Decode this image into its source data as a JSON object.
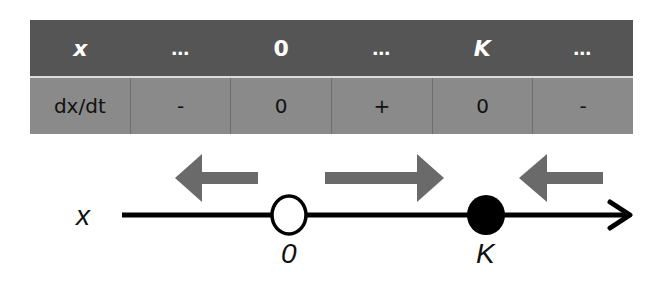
{
  "sign_table": {
    "header": [
      "x",
      "…",
      "0",
      "…",
      "K",
      "…"
    ],
    "row": [
      "dx/dt",
      "-",
      "0",
      "+",
      "0",
      "-"
    ]
  },
  "number_line": {
    "axis_label": "x",
    "points": [
      {
        "label": "0",
        "type": "open-circle",
        "meaning": "unstable equilibrium"
      },
      {
        "label": "K",
        "type": "filled-circle",
        "meaning": "stable equilibrium"
      }
    ],
    "flow_arrows": [
      "left",
      "right",
      "left"
    ]
  },
  "colors": {
    "header_bg": "#555555",
    "row_bg": "#8a8a8a",
    "arrow_fill": "#6a6a6a",
    "line": "#000000"
  }
}
